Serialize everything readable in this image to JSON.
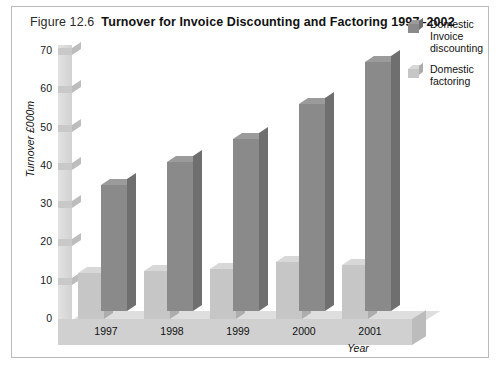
{
  "figure": {
    "number": "Figure 12.6",
    "title": "Turnover for Invoice Discounting and Factoring 1997–2002"
  },
  "colors": {
    "dark_bar": "#8a8a8a",
    "dark_bar_top": "#9b9b9b",
    "dark_bar_side": "#6f6f6f",
    "light_bar": "#c6c6c6",
    "light_bar_top": "#d8d8d8",
    "light_bar_side": "#adadad",
    "floor": "#d0d0d0",
    "wall": "#dcdcdc",
    "frame_border": "#b9b9b9",
    "text": "#111111"
  },
  "chart_data": {
    "type": "bar",
    "title": "Turnover for Invoice Discounting and Factoring 1997–2002",
    "xlabel": "Year",
    "ylabel": "Turnover £000m",
    "categories": [
      "1997",
      "1998",
      "1999",
      "2000",
      "2001"
    ],
    "series": [
      {
        "name": "Domestic factoring",
        "values": [
          12,
          12.5,
          13,
          15,
          14
        ]
      },
      {
        "name": "Domestic Invoice discounting",
        "values": [
          33,
          39,
          45,
          54,
          65
        ]
      }
    ],
    "ylim": [
      0,
      70
    ],
    "yticks": [
      0,
      10,
      20,
      30,
      40,
      50,
      60,
      70
    ],
    "ytick_labels": [
      "0",
      "10",
      "20",
      "30",
      "40",
      "50",
      "60",
      "70"
    ],
    "grid": false,
    "legend_position": "right",
    "three_d": true
  },
  "legend": {
    "items": [
      {
        "lines": [
          "Domestic",
          "Invoice",
          "discounting"
        ],
        "swatch": "dark"
      },
      {
        "lines": [
          "Domestic",
          "factoring"
        ],
        "swatch": "light"
      }
    ]
  }
}
